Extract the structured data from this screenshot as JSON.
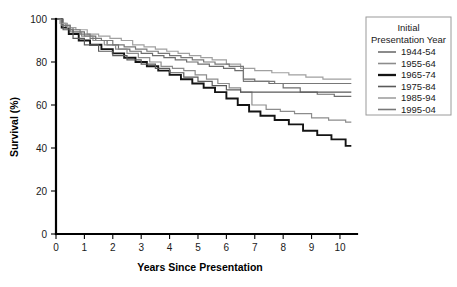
{
  "chart_data": {
    "type": "line",
    "title": "",
    "xlabel": "Years Since Presentation",
    "ylabel": "Survival (%)",
    "xlim": [
      0,
      10.6
    ],
    "ylim": [
      0,
      100
    ],
    "xticks": [
      "0",
      "1",
      "2",
      "3",
      "4",
      "5",
      "6",
      "7",
      "8",
      "9",
      "10"
    ],
    "yticks": [
      "0",
      "20",
      "40",
      "60",
      "80",
      "100"
    ],
    "grid": false,
    "legend_position": "right-outside",
    "legend_title_line1": "Initial",
    "legend_title_line2": "Presentation Year",
    "step_style": "post",
    "series": [
      {
        "name": "1944-54",
        "color": "#6e6e6e",
        "width": 1.2,
        "x": [
          0,
          0.15,
          0.35,
          0.6,
          1.0,
          1.4,
          1.8,
          2.2,
          2.6,
          3.0,
          3.4,
          3.8,
          4.2,
          4.6,
          5.0,
          5.4,
          5.9,
          6.3,
          6.6,
          7.0,
          7.5,
          8.0,
          8.6,
          9.2,
          9.8,
          10.4
        ],
        "y": [
          100,
          98,
          96,
          94,
          92,
          90,
          88,
          86,
          85,
          84,
          83,
          82,
          81,
          80,
          79,
          78,
          77,
          76,
          72,
          71,
          70,
          68,
          66,
          65,
          64,
          64
        ]
      },
      {
        "name": "1955-64",
        "color": "#8c8c8c",
        "width": 1.2,
        "x": [
          0,
          0.2,
          0.5,
          0.9,
          1.3,
          1.7,
          2.1,
          2.5,
          2.9,
          3.3,
          3.7,
          4.1,
          4.5,
          4.9,
          5.3,
          5.7,
          6.1,
          6.5,
          6.9,
          7.4,
          7.9,
          8.4,
          9.0,
          9.6,
          10.2,
          10.4
        ],
        "y": [
          100,
          97,
          94,
          92,
          90,
          88,
          86,
          84,
          82,
          80,
          78,
          77,
          76,
          74,
          72,
          70,
          68,
          66,
          60,
          58,
          57,
          56,
          54,
          53,
          52,
          52
        ]
      },
      {
        "name": "1965-74",
        "color": "#141414",
        "width": 1.9,
        "x": [
          0,
          0.2,
          0.45,
          0.8,
          1.2,
          1.6,
          2.0,
          2.4,
          2.8,
          3.2,
          3.6,
          4.0,
          4.4,
          4.8,
          5.2,
          5.6,
          6.0,
          6.4,
          6.8,
          7.2,
          7.7,
          8.2,
          8.7,
          9.2,
          9.7,
          10.2,
          10.4
        ],
        "y": [
          100,
          96,
          93,
          90,
          88,
          86,
          84,
          82,
          80,
          78,
          76,
          74,
          72,
          70,
          68,
          66,
          63,
          60,
          57,
          55,
          53,
          51,
          48,
          46,
          44,
          41,
          41
        ]
      },
      {
        "name": "1975-84",
        "color": "#5a5a5a",
        "width": 1.2,
        "x": [
          0,
          0.25,
          0.6,
          1.0,
          1.5,
          2.0,
          2.5,
          3.0,
          3.5,
          4.0,
          4.5,
          5.0,
          5.5,
          6.0,
          6.5,
          7.0,
          7.6,
          8.2,
          8.8,
          9.4,
          10.0,
          10.4
        ],
        "y": [
          100,
          95,
          91,
          88,
          85,
          83,
          81,
          79,
          77,
          75,
          73,
          71,
          69,
          67,
          66,
          66,
          66,
          66,
          66,
          66,
          66,
          66
        ]
      },
      {
        "name": "1985-94",
        "color": "#a0a0a0",
        "width": 1.2,
        "x": [
          0,
          0.15,
          0.4,
          0.7,
          1.1,
          1.5,
          1.9,
          2.3,
          2.7,
          3.1,
          3.5,
          3.9,
          4.3,
          4.7,
          5.1,
          5.5,
          6.0,
          6.5,
          7.0,
          7.6,
          8.2,
          8.8,
          9.4,
          10.0,
          10.4
        ],
        "y": [
          100,
          98,
          96,
          95,
          93,
          92,
          91,
          90,
          88,
          87,
          86,
          85,
          84,
          83,
          82,
          81,
          79,
          77,
          76,
          75,
          74,
          73,
          72,
          72,
          72
        ]
      },
      {
        "name": "1995-04",
        "color": "#787878",
        "width": 1.2,
        "x": [
          0,
          0.2,
          0.5,
          0.85,
          1.2,
          1.6,
          2.0,
          2.4,
          2.8,
          3.2,
          3.6,
          4.0,
          4.4,
          4.8,
          5.2,
          5.6,
          6.1,
          6.6,
          7.1,
          7.7,
          8.3,
          8.9,
          9.5,
          10.1,
          10.4
        ],
        "y": [
          100,
          97,
          95,
          93,
          91,
          90,
          88,
          87,
          86,
          85,
          84,
          83,
          82,
          81,
          80,
          79,
          78,
          71,
          71,
          70,
          70,
          70,
          70,
          70,
          70
        ]
      }
    ]
  }
}
